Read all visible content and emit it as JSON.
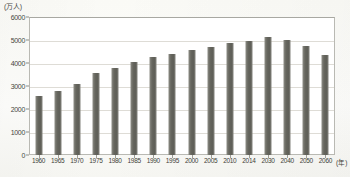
{
  "chart_data": {
    "type": "bar",
    "title": "",
    "subtitle": "",
    "unit_label": "(万人)",
    "xlabel": "(年)",
    "ylabel": "",
    "categories": [
      "1960",
      "1965",
      "1970",
      "1975",
      "1980",
      "1985",
      "1990",
      "1995",
      "2000",
      "2005",
      "2010",
      "2014",
      "2030",
      "2040",
      "2050",
      "2060"
    ],
    "values": [
      2550,
      2800,
      3100,
      3550,
      3800,
      4050,
      4250,
      4400,
      4550,
      4700,
      4850,
      4950,
      5150,
      5000,
      4750,
      4350
    ],
    "ylim": [
      0,
      6000
    ],
    "yticks": [
      0,
      1000,
      2000,
      3000,
      4000,
      5000,
      6000
    ],
    "ytick_labels": [
      "0",
      "1000",
      "2000",
      "3000",
      "4000",
      "5000",
      "6000"
    ],
    "grid": true,
    "legend": false,
    "legend_position": "none",
    "series_color": "#67675f"
  },
  "colors": {
    "bar": "#67675f",
    "gridline": "#dedcd6",
    "frame": "#b9b9b3",
    "text": "#3f3f39",
    "background": "#fdfdfc"
  }
}
